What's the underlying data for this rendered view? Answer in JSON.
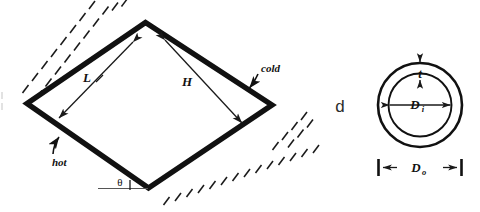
{
  "figure": {
    "background_color": "#ffffff",
    "line_color": "#111111",
    "panels": [
      {
        "id": "enclosure",
        "type": "inclined-rectangular-enclosure-cross-section",
        "labels": {
          "length": "L",
          "height": "H",
          "hot_wall": "hot",
          "cold_wall": "cold",
          "angle": "θ"
        }
      },
      {
        "id": "annulus",
        "panel_label": "d",
        "type": "circular-tube-cross-section",
        "labels": {
          "thickness": "t",
          "inner_diameter": "D",
          "inner_diameter_sub": "i",
          "outer_diameter": "D",
          "outer_diameter_sub": "o"
        }
      }
    ]
  },
  "enclosure": {
    "label_L": "L",
    "label_H": "H",
    "label_hot": "hot",
    "label_cold": "cold",
    "label_theta": "θ"
  },
  "annulus": {
    "panel_label": "d",
    "label_t": "t",
    "label_Di": "D",
    "label_Di_sub": "i",
    "label_Do": "D",
    "label_Do_sub": "o"
  }
}
